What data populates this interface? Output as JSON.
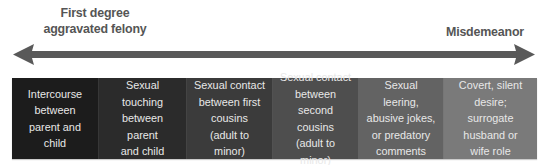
{
  "scale": {
    "left_label": "First degree\naggravated felony",
    "right_label": "Misdemeanor",
    "arrow_color": "#595959"
  },
  "boxes": [
    {
      "label": "Intercourse between parent and child",
      "lines": [
        "Intercourse",
        "between",
        "parent and child"
      ],
      "color": "#1c1c1c"
    },
    {
      "label": "Sexual touching between parent and child",
      "lines": [
        "Sexual touching",
        "between parent",
        "and child"
      ],
      "color": "#2b2b2b"
    },
    {
      "label": "Sexual contact between first cousins (adult to minor)",
      "lines": [
        "Sexual contact",
        "between first",
        "cousins",
        "(adult to minor)"
      ],
      "color": "#3b3b3b"
    },
    {
      "label": "Sexual contact between second cousins (adult to minor)",
      "lines": [
        "Sexual contact",
        "between second",
        "cousins",
        "(adult to minor)"
      ],
      "color": "#4e4e4e"
    },
    {
      "label": "Sexual leering, abusive jokes, or predatory comments",
      "lines": [
        "Sexual leering,",
        "abusive jokes,",
        "or predatory",
        "comments"
      ],
      "color": "#636363"
    },
    {
      "label": "Covert, silent desire; surrogate husband or wife role",
      "lines": [
        "Covert, silent",
        "desire; surrogate",
        "husband or",
        "wife role"
      ],
      "color": "#7a7a7a"
    }
  ]
}
